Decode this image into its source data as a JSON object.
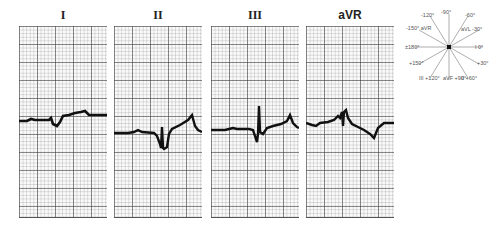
{
  "leads": [
    {
      "label": "I"
    },
    {
      "label": "II"
    },
    {
      "label": "III"
    },
    {
      "label": "aVR"
    }
  ],
  "hexaxial": {
    "labels": [
      "-120°",
      "-90°",
      "-60°",
      "-150° aVR",
      "aVL -30°",
      "±180°",
      "I 0°",
      "+150°",
      "+30°",
      "III +120°",
      "aVF +90°",
      "II +60°"
    ]
  }
}
